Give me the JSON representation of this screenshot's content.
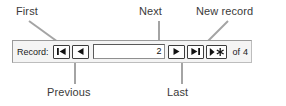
{
  "callouts": [
    {
      "id": "first",
      "label": "First"
    },
    {
      "id": "next",
      "label": "Next"
    },
    {
      "id": "new_record",
      "label": "New record"
    },
    {
      "id": "previous",
      "label": "Previous"
    },
    {
      "id": "last",
      "label": "Last"
    }
  ],
  "labels": {
    "first": "First",
    "next": "Next",
    "new_record": "New record",
    "previous": "Previous",
    "last": "Last"
  },
  "record_nav": {
    "record_label": "Record:",
    "current_record": "2",
    "of_word": "of",
    "total_records": "4",
    "buttons": [
      {
        "name": "first-record-button",
        "icon": "first-record-icon",
        "title": "First"
      },
      {
        "name": "previous-record-button",
        "icon": "previous-record-icon",
        "title": "Previous"
      },
      {
        "name": "next-record-button",
        "icon": "next-record-icon",
        "title": "Next"
      },
      {
        "name": "last-record-button",
        "icon": "last-record-icon",
        "title": "Last"
      },
      {
        "name": "new-record-button",
        "icon": "new-record-icon",
        "title": "New record"
      }
    ]
  },
  "colors": {
    "page_background": "#ffffff",
    "bar_background": "#f4f4f4",
    "bar_border": "#9a9a9a",
    "button_face": "#fdfdfd",
    "button_border": "#3c3c3c",
    "field_background": "#ffffff",
    "field_border": "#5a5a5a",
    "text": "#1a1a1a",
    "callout_text": "#3a3a3a",
    "leader_line": "#9e9e9e"
  }
}
